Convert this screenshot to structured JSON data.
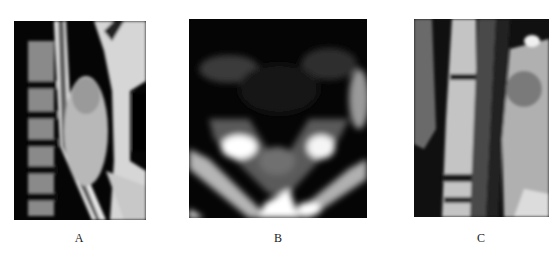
{
  "figure": {
    "panels": [
      {
        "id": "A",
        "label": "A",
        "description": "Sagittal MRI of cervical spine showing posterior mass"
      },
      {
        "id": "B",
        "label": "B",
        "description": "Axial MRI slice of cervical region"
      },
      {
        "id": "C",
        "label": "C",
        "description": "Sagittal MRI of cervical spine, closer view"
      }
    ]
  }
}
